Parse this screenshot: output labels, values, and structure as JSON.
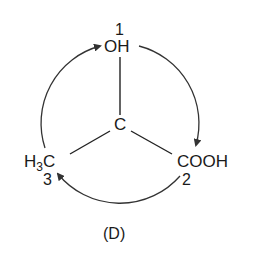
{
  "diagram": {
    "center": {
      "label": "C"
    },
    "groups": [
      {
        "label": "OH",
        "priority": "1",
        "position": "top"
      },
      {
        "label": "COOH",
        "priority": "2",
        "position": "bottom-right"
      },
      {
        "label": "H3C",
        "label_main": "H",
        "label_sub": "3",
        "label_end": "C",
        "priority": "3",
        "position": "bottom-left"
      }
    ],
    "rotation": "clockwise 1 → 2 → 3",
    "caption": "(D)"
  }
}
